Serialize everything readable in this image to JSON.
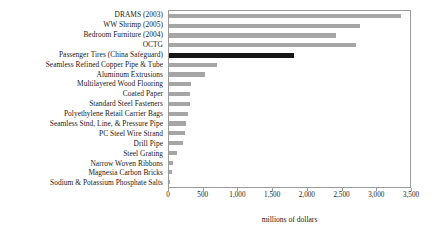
{
  "chart_data": {
    "type": "bar",
    "orientation": "horizontal",
    "title": "",
    "xlabel": "millions of dollars",
    "ylabel": "",
    "xlim": [
      0,
      3500
    ],
    "xticks": [
      0,
      500,
      1000,
      1500,
      2000,
      2500,
      3000,
      3500
    ],
    "xtick_labels": [
      "0",
      "500",
      "1,000",
      "1,500",
      "2,000",
      "2,500",
      "3,000",
      "3,500"
    ],
    "grid": false,
    "legend": false,
    "bar_color": "#a6a6a6",
    "highlight_color": "#161616",
    "categories": [
      "DRAMS (2003)",
      "WW Shrimp (2005)",
      "Bedroom Furniture (2004)",
      "OCTG",
      "Passenger Tires (China Safeguard)",
      "Seamless Refined Copper Pipe & Tube",
      "Aluminum Extrusions",
      "Multilayered Wood Flooring",
      "Coated Paper",
      "Standard Steel Fasteners",
      "Polyethylene Retail Carrier Bags",
      "Seamless Stnd, Line, & Pressure Pipe",
      "PC Steel Wire Strand",
      "Drill Pipe",
      "Steel Grating",
      "Narrow Woven Ribbons",
      "Magnesia Carbon Bricks",
      "Sodium & Potassium Phosphate Salts"
    ],
    "values": [
      3340,
      2750,
      2400,
      2700,
      1800,
      690,
      520,
      310,
      300,
      300,
      270,
      250,
      230,
      200,
      120,
      60,
      40,
      10
    ],
    "highlight_index": 4,
    "highlight_label": "Passenger Tires (China Safeguard)"
  }
}
